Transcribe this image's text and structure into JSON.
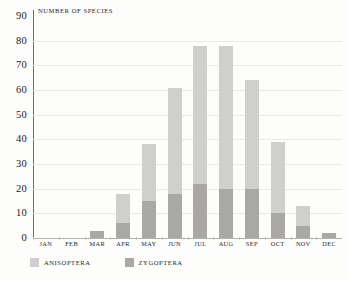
{
  "chart_data": {
    "type": "bar",
    "title": "",
    "subtitle": "",
    "xlabel": "",
    "ylabel": "NUMBER OF SPECIES",
    "ylim": [
      0,
      90
    ],
    "ytick_step": 10,
    "yticks": [
      "90",
      "80",
      "70",
      "60",
      "50",
      "40",
      "30",
      "20",
      "10",
      "0"
    ],
    "grid": true,
    "stacked": true,
    "legend_position": "bottom-left",
    "categories": [
      "JAN",
      "FEB",
      "MAR",
      "APR",
      "MAY",
      "JUN",
      "JUL",
      "AUG",
      "SEP",
      "OCT",
      "NOV",
      "DEC"
    ],
    "series": [
      {
        "name": "ZYGOPTERA",
        "color": "#a9a8a5",
        "values": [
          0,
          0,
          3,
          6,
          15,
          18,
          22,
          20,
          20,
          10,
          5,
          2
        ]
      },
      {
        "name": "ANISOPTERA",
        "color": "#cfcfcd",
        "values": [
          0,
          0,
          0,
          12,
          23,
          43,
          56,
          58,
          44,
          29,
          8,
          0
        ]
      }
    ],
    "totals": [
      0,
      0,
      3,
      18,
      38,
      61,
      78,
      78,
      64,
      39,
      13,
      2
    ]
  },
  "legend": {
    "items": [
      {
        "label": "ANISOPTERA",
        "color": "#cfcfcd"
      },
      {
        "label": "ZYGOPTERA",
        "color": "#a9a8a5"
      }
    ]
  },
  "colors": {
    "background": "#fdfdfc",
    "gridline": "#e9e9e7",
    "axis": "#6d6b67",
    "baseline": "#b4b2ae",
    "text": "#2a2724",
    "anisoptera": "#cfcfcd",
    "zygoptera": "#a9a8a5"
  }
}
